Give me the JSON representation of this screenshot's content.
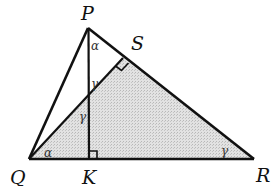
{
  "diagram": {
    "title": "",
    "points": {
      "P": {
        "label": "P",
        "x": 88,
        "y": 28
      },
      "Q": {
        "label": "Q",
        "x": 29,
        "y": 159
      },
      "R": {
        "label": "R",
        "x": 254,
        "y": 159
      },
      "S": {
        "label": "S",
        "x": 123,
        "y": 58
      },
      "K": {
        "label": "K",
        "x": 89,
        "y": 159
      }
    },
    "segments": [
      "PQ",
      "PR",
      "QR",
      "PK",
      "QS"
    ],
    "shaded_region": "triangle QSR",
    "right_angles": [
      "at S (QS ⟂ PR)",
      "at K (PK ⟂ QR)"
    ],
    "angle_labels": [
      {
        "symbol": "α",
        "at": "P",
        "between": "KPR"
      },
      {
        "symbol": "γ",
        "at": "intersection of PK and QS (upper)"
      },
      {
        "symbol": "γ",
        "at": "intersection of PK and QS (lower)"
      },
      {
        "symbol": "α",
        "at": "Q",
        "between": "SQR"
      },
      {
        "symbol": "γ",
        "at": "R"
      }
    ],
    "colors": {
      "stroke": "#111111",
      "shade": "#d4d4d4"
    }
  }
}
